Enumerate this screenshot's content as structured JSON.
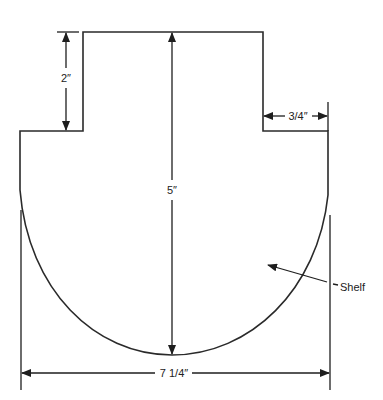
{
  "diagram": {
    "colors": {
      "line": "#2a2a2a",
      "background": "#ffffff"
    },
    "labels": {
      "top_height": "2″",
      "total_height": "5″",
      "side_width": "3/4″",
      "total_width": "7 1/4″",
      "part_name": "Shelf"
    },
    "dimensions": [
      {
        "name": "top-block-height",
        "value": "2″"
      },
      {
        "name": "overall-height",
        "value": "5″"
      },
      {
        "name": "shoulder-width",
        "value": "3/4″"
      },
      {
        "name": "overall-width",
        "value": "7 1/4″"
      }
    ]
  }
}
